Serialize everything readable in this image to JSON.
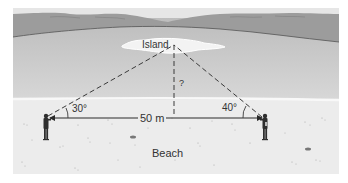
{
  "diagram": {
    "island_label": "Island",
    "height_label": "?",
    "distance_label": "50 m",
    "left_angle_label": "30°",
    "right_angle_label": "40°",
    "beach_label": "Beach",
    "colors": {
      "background": "#ffffff",
      "hills": "#9a9a9a",
      "hills_far": "#b5b5b5",
      "water": "#c6c6c6",
      "water_light": "#d3d3d3",
      "island": "#f2f2f2",
      "beach": "#eeeeee",
      "line": "#3a3a3a",
      "figure": "#2e2e2e"
    }
  }
}
